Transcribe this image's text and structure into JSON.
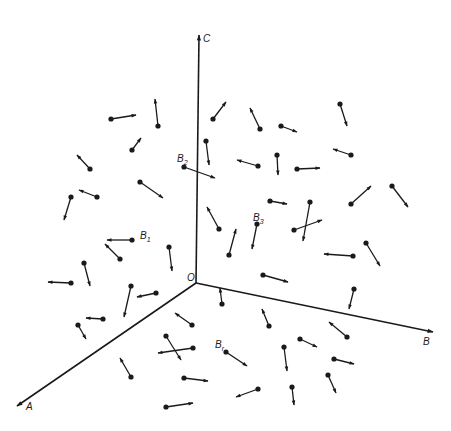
{
  "diagram": {
    "type": "3d-axes-vector-field",
    "color": "#1a1a1a",
    "origin": {
      "x": 196,
      "y": 283,
      "label": "O",
      "label_pos": [
        187,
        281
      ]
    },
    "axes": [
      {
        "name": "C",
        "end": [
          199,
          35
        ],
        "label_pos": [
          203,
          42
        ]
      },
      {
        "name": "B",
        "end": [
          433,
          332
        ],
        "label_pos": [
          423,
          345
        ]
      },
      {
        "name": "A",
        "end": [
          17,
          406
        ],
        "label_pos": [
          26,
          410
        ]
      }
    ],
    "labeled_vectors": [
      {
        "label": "B",
        "sub": "1",
        "label_pos": [
          140,
          239
        ]
      },
      {
        "label": "B",
        "sub": "2",
        "label_pos": [
          177,
          162
        ]
      },
      {
        "label": "B",
        "sub": "3",
        "label_pos": [
          253,
          221
        ]
      },
      {
        "label": "B",
        "sub": "r",
        "label_pos": [
          215,
          348
        ]
      }
    ],
    "vectors": [
      {
        "tail": [
          111,
          119
        ],
        "head": [
          136,
          115
        ]
      },
      {
        "tail": [
          158,
          126
        ],
        "head": [
          155,
          99
        ]
      },
      {
        "tail": [
          132,
          150
        ],
        "head": [
          141,
          138
        ]
      },
      {
        "tail": [
          90,
          169
        ],
        "head": [
          77,
          155
        ]
      },
      {
        "tail": [
          140,
          182
        ],
        "head": [
          163,
          198
        ]
      },
      {
        "tail": [
          97,
          197
        ],
        "head": [
          79,
          190
        ]
      },
      {
        "tail": [
          71,
          197
        ],
        "head": [
          64,
          220
        ]
      },
      {
        "tail": [
          132,
          240
        ],
        "head": [
          107,
          240
        ]
      },
      {
        "tail": [
          120,
          259
        ],
        "head": [
          105,
          244
        ]
      },
      {
        "tail": [
          84,
          263
        ],
        "head": [
          90,
          286
        ]
      },
      {
        "tail": [
          71,
          283
        ],
        "head": [
          48,
          282
        ]
      },
      {
        "tail": [
          131,
          286
        ],
        "head": [
          124,
          317
        ]
      },
      {
        "tail": [
          156,
          293
        ],
        "head": [
          137,
          297
        ]
      },
      {
        "tail": [
          103,
          319
        ],
        "head": [
          86,
          318
        ]
      },
      {
        "tail": [
          78,
          325
        ],
        "head": [
          86,
          339
        ]
      },
      {
        "tail": [
          192,
          325
        ],
        "head": [
          175,
          313
        ]
      },
      {
        "tail": [
          166,
          336
        ],
        "head": [
          181,
          360
        ]
      },
      {
        "tail": [
          193,
          348
        ],
        "head": [
          158,
          353
        ]
      },
      {
        "tail": [
          131,
          377
        ],
        "head": [
          120,
          358
        ]
      },
      {
        "tail": [
          184,
          378
        ],
        "head": [
          208,
          381
        ]
      },
      {
        "tail": [
          166,
          407
        ],
        "head": [
          193,
          403
        ]
      },
      {
        "tail": [
          184,
          167
        ],
        "head": [
          215,
          178
        ]
      },
      {
        "tail": [
          213,
          119
        ],
        "head": [
          226,
          102
        ]
      },
      {
        "tail": [
          260,
          129
        ],
        "head": [
          250,
          108
        ]
      },
      {
        "tail": [
          281,
          126
        ],
        "head": [
          297,
          132
        ]
      },
      {
        "tail": [
          340,
          104
        ],
        "head": [
          347,
          126
        ]
      },
      {
        "tail": [
          206,
          141
        ],
        "head": [
          209,
          165
        ]
      },
      {
        "tail": [
          258,
          166
        ],
        "head": [
          237,
          160
        ]
      },
      {
        "tail": [
          277,
          155
        ],
        "head": [
          278,
          175
        ]
      },
      {
        "tail": [
          297,
          169
        ],
        "head": [
          320,
          168
        ]
      },
      {
        "tail": [
          351,
          155
        ],
        "head": [
          333,
          149
        ]
      },
      {
        "tail": [
          219,
          229
        ],
        "head": [
          207,
          207
        ]
      },
      {
        "tail": [
          229,
          255
        ],
        "head": [
          236,
          229
        ]
      },
      {
        "tail": [
          257,
          224
        ],
        "head": [
          252,
          249
        ]
      },
      {
        "tail": [
          169,
          247
        ],
        "head": [
          172,
          271
        ]
      },
      {
        "tail": [
          270,
          201
        ],
        "head": [
          287,
          204
        ]
      },
      {
        "tail": [
          310,
          202
        ],
        "head": [
          303,
          241
        ]
      },
      {
        "tail": [
          294,
          230
        ],
        "head": [
          322,
          220
        ]
      },
      {
        "tail": [
          351,
          204
        ],
        "head": [
          371,
          186
        ]
      },
      {
        "tail": [
          392,
          186
        ],
        "head": [
          408,
          207
        ]
      },
      {
        "tail": [
          353,
          256
        ],
        "head": [
          324,
          254
        ]
      },
      {
        "tail": [
          366,
          243
        ],
        "head": [
          380,
          266
        ]
      },
      {
        "tail": [
          263,
          275
        ],
        "head": [
          288,
          282
        ]
      },
      {
        "tail": [
          354,
          289
        ],
        "head": [
          349,
          309
        ]
      },
      {
        "tail": [
          222,
          304
        ],
        "head": [
          220,
          288
        ]
      },
      {
        "tail": [
          269,
          326
        ],
        "head": [
          262,
          309
        ]
      },
      {
        "tail": [
          347,
          337
        ],
        "head": [
          329,
          322
        ]
      },
      {
        "tail": [
          300,
          339
        ],
        "head": [
          317,
          347
        ]
      },
      {
        "tail": [
          226,
          352
        ],
        "head": [
          247,
          366
        ]
      },
      {
        "tail": [
          284,
          347
        ],
        "head": [
          287,
          371
        ]
      },
      {
        "tail": [
          334,
          359
        ],
        "head": [
          354,
          364
        ]
      },
      {
        "tail": [
          328,
          375
        ],
        "head": [
          336,
          393
        ]
      },
      {
        "tail": [
          258,
          389
        ],
        "head": [
          236,
          397
        ]
      },
      {
        "tail": [
          292,
          387
        ],
        "head": [
          294,
          405
        ]
      }
    ]
  }
}
